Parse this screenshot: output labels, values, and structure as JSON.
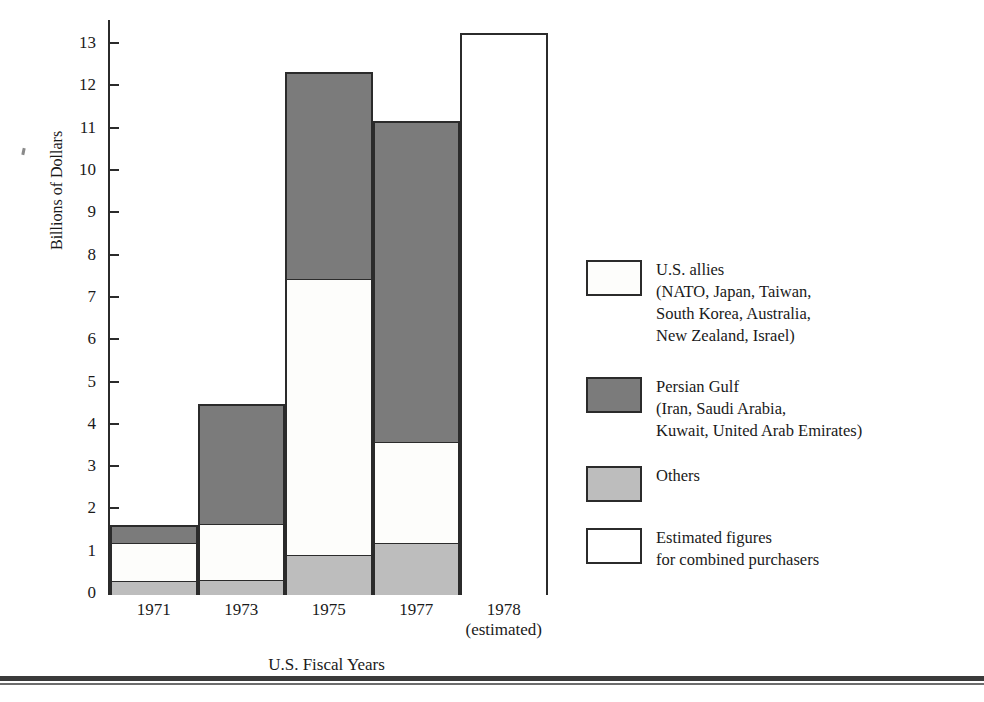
{
  "chart_data": {
    "type": "bar",
    "subtype": "stacked",
    "title": "",
    "xlabel": "U.S. Fiscal Years",
    "ylabel": "Billions of Dollars",
    "ylim": [
      0,
      13.6
    ],
    "yticks": [
      0,
      1,
      2,
      3,
      4,
      5,
      6,
      7,
      8,
      9,
      10,
      11,
      12,
      13
    ],
    "ytick_labels": [
      "0",
      "1",
      "2",
      "3",
      "4",
      "5",
      "6",
      "7",
      "8",
      "9",
      "10",
      "11",
      "12",
      "13"
    ],
    "grid": false,
    "legend_position": "right",
    "categories": [
      "1971",
      "1973",
      "1975",
      "1977",
      "1978"
    ],
    "category_labels": [
      {
        "line1": "1971",
        "line2": ""
      },
      {
        "line1": "1973",
        "line2": ""
      },
      {
        "line1": "1975",
        "line2": ""
      },
      {
        "line1": "1977",
        "line2": ""
      },
      {
        "line1": "1978",
        "line2": "(estimated)"
      }
    ],
    "series": [
      {
        "name": "Others",
        "key": "others",
        "color": "#bdbdbd",
        "values": [
          0.3,
          0.33,
          0.93,
          1.2,
          null
        ]
      },
      {
        "name": "U.S. allies",
        "key": "allies",
        "color": "#fdfdfb",
        "values": [
          0.9,
          1.33,
          6.52,
          2.4,
          null
        ]
      },
      {
        "name": "Persian Gulf",
        "key": "gulf",
        "color": "#7b7b7b",
        "values": [
          0.4,
          2.81,
          4.87,
          7.57,
          null
        ]
      },
      {
        "name": "Estimated figures for combined purchasers",
        "key": "estimated",
        "color": "#ffffff",
        "values": [
          null,
          null,
          null,
          null,
          13.25
        ]
      }
    ],
    "totals": [
      1.6,
      4.47,
      12.32,
      11.17,
      13.25
    ],
    "bars": [
      {
        "category": "1971",
        "total": 1.6,
        "segments": [
          {
            "key": "others",
            "from": 0.0,
            "to": 0.3
          },
          {
            "key": "allies",
            "from": 0.3,
            "to": 1.2
          },
          {
            "key": "gulf",
            "from": 1.2,
            "to": 1.6
          }
        ]
      },
      {
        "category": "1973",
        "total": 4.47,
        "segments": [
          {
            "key": "others",
            "from": 0.0,
            "to": 0.33
          },
          {
            "key": "allies",
            "from": 0.33,
            "to": 1.66
          },
          {
            "key": "gulf",
            "from": 1.66,
            "to": 4.47
          }
        ]
      },
      {
        "category": "1975",
        "total": 12.32,
        "segments": [
          {
            "key": "others",
            "from": 0.0,
            "to": 0.93
          },
          {
            "key": "allies",
            "from": 0.93,
            "to": 7.45
          },
          {
            "key": "gulf",
            "from": 7.45,
            "to": 12.32
          }
        ]
      },
      {
        "category": "1977",
        "total": 11.17,
        "segments": [
          {
            "key": "others",
            "from": 0.0,
            "to": 1.2
          },
          {
            "key": "allies",
            "from": 1.2,
            "to": 3.6
          },
          {
            "key": "gulf",
            "from": 3.6,
            "to": 11.17
          }
        ]
      },
      {
        "category": "1978",
        "total": 13.25,
        "segments": [
          {
            "key": "estimated",
            "from": 0.0,
            "to": 13.25
          }
        ]
      }
    ]
  },
  "axes": {
    "y_title": "Billions of Dollars",
    "x_title": "U.S. Fiscal Years"
  },
  "legend": {
    "items": [
      {
        "swatch": "allies",
        "color": "#fdfdfb",
        "text": "U.S. allies\n(NATO, Japan, Taiwan,\nSouth Korea, Australia,\nNew Zealand, Israel)"
      },
      {
        "swatch": "gulf",
        "color": "#7b7b7b",
        "text": "Persian Gulf\n(Iran, Saudi Arabia,\nKuwait, United Arab Emirates)"
      },
      {
        "swatch": "others",
        "color": "#bdbdbd",
        "text": "Others"
      },
      {
        "swatch": "estimated",
        "color": "#ffffff",
        "text": "Estimated figures\nfor combined purchasers"
      }
    ]
  },
  "footer": {
    "caption": ""
  }
}
